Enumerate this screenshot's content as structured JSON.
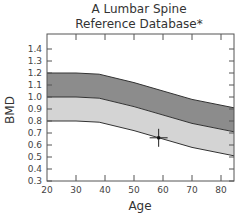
{
  "chart_data": {
    "type": "area",
    "title_lines": [
      "A Lumbar Spine",
      "Reference Database*"
    ],
    "xlabel": "Age",
    "ylabel": "BMD",
    "xlim": [
      20,
      85
    ],
    "ylim": [
      0.3,
      1.45
    ],
    "x_ticks": [
      20,
      30,
      40,
      50,
      60,
      70,
      80
    ],
    "y_ticks": [
      0.3,
      0.4,
      0.5,
      0.6,
      0.7,
      0.8,
      0.9,
      1.0,
      1.1,
      1.2,
      1.3,
      1.4
    ],
    "y_tick_labels": [
      "0.3",
      "0.4",
      "0.5",
      "0.6",
      "0.7",
      "0.8",
      "0.9",
      "1.0",
      "1.1",
      "1.2",
      "1.3",
      "1.4"
    ],
    "grid": false,
    "x": [
      20,
      30,
      38,
      50,
      60,
      70,
      85
    ],
    "series": [
      {
        "name": "upper bound (+1 SD)",
        "values": [
          1.2,
          1.2,
          1.19,
          1.12,
          1.05,
          0.98,
          0.91
        ]
      },
      {
        "name": "mean",
        "values": [
          1.0,
          1.0,
          0.99,
          0.92,
          0.85,
          0.78,
          0.71
        ]
      },
      {
        "name": "lower bound (-1 SD)",
        "values": [
          0.8,
          0.8,
          0.79,
          0.72,
          0.65,
          0.58,
          0.51
        ]
      }
    ],
    "bands": [
      {
        "name": "upper band",
        "from": "mean",
        "to": "upper bound (+1 SD)",
        "color": "#8c8c8c"
      },
      {
        "name": "lower band",
        "from": "lower bound (-1 SD)",
        "to": "mean",
        "color": "#d4d4d4"
      }
    ],
    "annotations": [
      {
        "type": "crosshair-marker",
        "x": 58.5,
        "y": 0.66
      }
    ]
  },
  "colors": {
    "upper_band": "#8c8c8c",
    "lower_band": "#d4d4d4",
    "axis": "#555555",
    "line": "#333333"
  }
}
